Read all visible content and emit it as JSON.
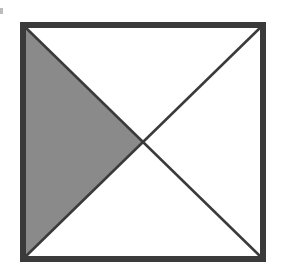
{
  "diagram": {
    "shape": "square",
    "divisions": 4,
    "shaded_region": "left-triangle",
    "shaded_fraction": "1/4",
    "colors": {
      "border": "#3a3a3a",
      "shade": "#8a8a8a",
      "background": "#ffffff"
    }
  }
}
